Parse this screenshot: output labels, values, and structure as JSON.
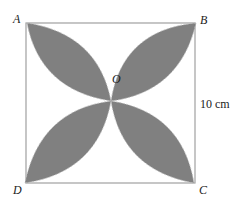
{
  "figure": {
    "labels": {
      "A": "A",
      "B": "B",
      "C": "C",
      "D": "D",
      "O": "O"
    },
    "dimension": "10 cm",
    "colors": {
      "petal_fill": "#808080",
      "square_stroke": "#a0a0a0",
      "text": "#222222"
    }
  }
}
